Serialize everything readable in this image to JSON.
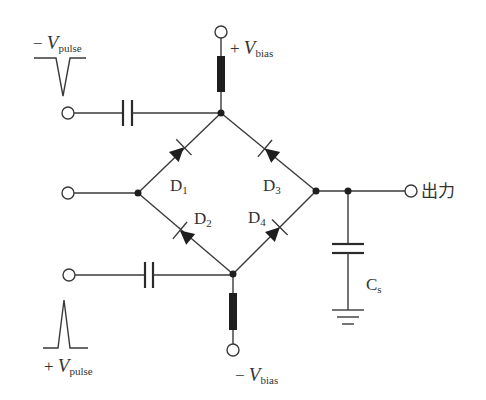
{
  "diagram": {
    "type": "diode-bridge sampling gate circuit",
    "colors": {
      "line": "#3a3a3a",
      "fill": "#1e1e1e",
      "background": "#ffffff"
    },
    "labels": {
      "neg_pulse": {
        "sign": "−",
        "symbol": "V",
        "sub": "pulse"
      },
      "pos_pulse": {
        "sign": "+",
        "symbol": "V",
        "sub": "pulse"
      },
      "pos_bias": {
        "sign": "+",
        "symbol": "V",
        "sub": "bias"
      },
      "neg_bias": {
        "sign": "−",
        "symbol": "V",
        "sub": "bias"
      },
      "d1": {
        "symbol": "D",
        "sub": "1"
      },
      "d2": {
        "symbol": "D",
        "sub": "2"
      },
      "d3": {
        "symbol": "D",
        "sub": "3"
      },
      "d4": {
        "symbol": "D",
        "sub": "4"
      },
      "cs": {
        "symbol": "C",
        "sub": "s"
      },
      "output": "出力"
    },
    "components": [
      "negative pulse input terminal with coupling capacitor",
      "positive pulse input terminal with coupling capacitor",
      "signal input terminal",
      "+Vbias terminal with resistor",
      "-Vbias terminal with resistor",
      "diode bridge D1-D4",
      "hold capacitor Cs to ground",
      "output terminal"
    ]
  }
}
